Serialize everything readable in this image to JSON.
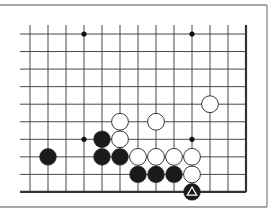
{
  "board": {
    "type": "go-diagram",
    "visible_columns": 13,
    "visible_rows": 10,
    "open_edges": [
      "top",
      "left"
    ],
    "closed_edges": [
      "right",
      "bottom"
    ],
    "colors": {
      "background": "#ffffff",
      "line": "#333333",
      "black_stone": "#1a1a1a",
      "white_stone": "#ffffff",
      "frame": "#888888"
    },
    "star_points": [
      {
        "col": 3,
        "row": 0
      },
      {
        "col": 9,
        "row": 0
      },
      {
        "col": 3,
        "row": 6
      },
      {
        "col": 9,
        "row": 6
      }
    ],
    "stones": [
      {
        "color": "black",
        "col": 1,
        "row": 7
      },
      {
        "color": "black",
        "col": 4,
        "row": 6
      },
      {
        "color": "black",
        "col": 4,
        "row": 7
      },
      {
        "color": "black",
        "col": 5,
        "row": 7
      },
      {
        "color": "black",
        "col": 6,
        "row": 8
      },
      {
        "color": "black",
        "col": 7,
        "row": 8
      },
      {
        "color": "black",
        "col": 8,
        "row": 8
      },
      {
        "color": "black",
        "col": 9,
        "row": 9,
        "marker": "triangle"
      },
      {
        "color": "white",
        "col": 10,
        "row": 4
      },
      {
        "color": "white",
        "col": 5,
        "row": 5
      },
      {
        "color": "white",
        "col": 7,
        "row": 5
      },
      {
        "color": "white",
        "col": 5,
        "row": 6
      },
      {
        "color": "white",
        "col": 6,
        "row": 7
      },
      {
        "color": "white",
        "col": 7,
        "row": 7
      },
      {
        "color": "white",
        "col": 8,
        "row": 7
      },
      {
        "color": "white",
        "col": 9,
        "row": 7
      },
      {
        "color": "white",
        "col": 9,
        "row": 8
      }
    ]
  }
}
